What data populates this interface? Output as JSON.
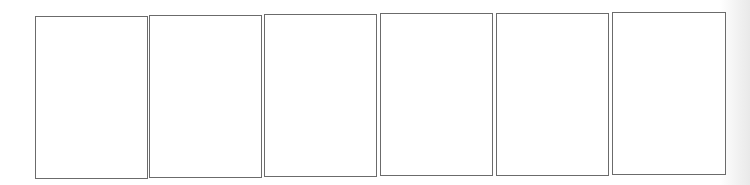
{
  "page": {
    "type": "blank storyboard / comic panel sheet",
    "background_color": "#ffffff",
    "border_color": "#6b6b6b"
  },
  "panels": [
    {
      "index": 1,
      "content": "",
      "x": 35,
      "y": 16,
      "w": 113,
      "h": 163
    },
    {
      "index": 2,
      "content": "",
      "x": 149,
      "y": 15,
      "w": 113,
      "h": 163
    },
    {
      "index": 3,
      "content": "",
      "x": 264,
      "y": 14,
      "w": 113,
      "h": 163
    },
    {
      "index": 4,
      "content": "",
      "x": 380,
      "y": 13,
      "w": 113,
      "h": 163
    },
    {
      "index": 5,
      "content": "",
      "x": 496,
      "y": 13,
      "w": 113,
      "h": 163
    },
    {
      "index": 6,
      "content": "",
      "x": 612,
      "y": 12,
      "w": 114,
      "h": 163
    }
  ]
}
